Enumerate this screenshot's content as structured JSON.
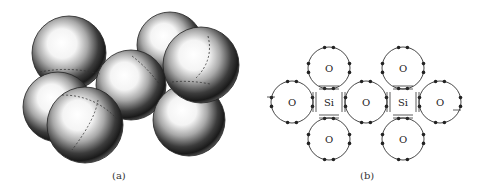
{
  "figure": {
    "panel_a": {
      "caption": "(a)",
      "description": "Space-filling model of silicate tetrahedra: shaded spheres",
      "spheres": [
        {
          "cx": 170,
          "cy": 45,
          "r": 33
        },
        {
          "cx": 69,
          "cy": 53,
          "r": 37
        },
        {
          "cx": 58,
          "cy": 107,
          "r": 35
        },
        {
          "cx": 131,
          "cy": 85,
          "r": 35
        },
        {
          "cx": 189,
          "cy": 120,
          "r": 36
        },
        {
          "cx": 201,
          "cy": 65,
          "r": 38
        },
        {
          "cx": 85,
          "cy": 125,
          "r": 38
        }
      ]
    },
    "panel_b": {
      "caption": "(b)",
      "atoms": [
        {
          "label": "O",
          "cx": 84,
          "cy": 68,
          "r": 21
        },
        {
          "label": "O",
          "cx": 158,
          "cy": 68,
          "r": 21
        },
        {
          "label": "O",
          "cx": 47,
          "cy": 102,
          "r": 21
        },
        {
          "label": "Si",
          "cx": 84,
          "cy": 102,
          "r": 14
        },
        {
          "label": "O",
          "cx": 121,
          "cy": 102,
          "r": 21
        },
        {
          "label": "Si",
          "cx": 158,
          "cy": 102,
          "r": 14
        },
        {
          "label": "O",
          "cx": 195,
          "cy": 102,
          "r": 21
        },
        {
          "label": "O",
          "cx": 84,
          "cy": 139,
          "r": 21
        },
        {
          "label": "O",
          "cx": 158,
          "cy": 139,
          "r": 21
        }
      ]
    }
  }
}
